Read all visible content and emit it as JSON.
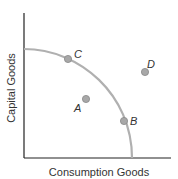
{
  "diagram": {
    "type": "production-possibilities-frontier",
    "x_axis_label": "Consumption Goods",
    "y_axis_label": "Capital Goods",
    "colors": {
      "axis": "#222222",
      "curve": "#b0b0b0",
      "point_fill": "#a8a8a8",
      "point_stroke": "#888888",
      "text": "#333333"
    },
    "points": [
      {
        "label": "A",
        "position": "inside frontier"
      },
      {
        "label": "B",
        "position": "on frontier"
      },
      {
        "label": "C",
        "position": "on frontier"
      },
      {
        "label": "D",
        "position": "outside frontier"
      }
    ]
  }
}
